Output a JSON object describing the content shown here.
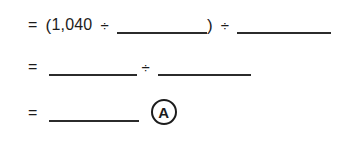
{
  "worksheet": {
    "background_color": "#ffffff",
    "ink_color": "#1c1c1c",
    "lines": [
      {
        "id": "line-1",
        "equals": "=",
        "open_paren": "(",
        "dividend": "1,040",
        "divide_1": "÷",
        "blank_1": "",
        "close_paren": ")",
        "divide_2": "÷",
        "blank_2": ""
      },
      {
        "id": "line-2",
        "equals": "=",
        "blank_1": "",
        "divide_1": "÷",
        "blank_2": ""
      },
      {
        "id": "line-3",
        "equals": "=",
        "blank_1": "",
        "answer_marker": "A"
      }
    ]
  }
}
